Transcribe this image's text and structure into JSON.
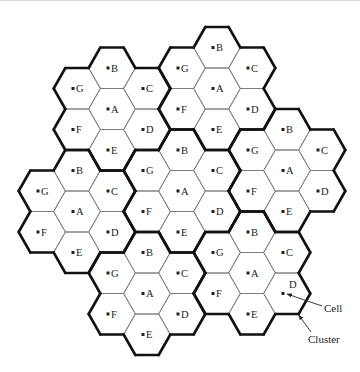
{
  "diagram": {
    "geometry": {
      "hex_radius": 23.33,
      "hex_height": 41
    },
    "cell_offsets": {
      "A": [
        0,
        0
      ],
      "B": [
        0,
        -1
      ],
      "C": [
        1,
        -0.5
      ],
      "D": [
        1,
        0.5
      ],
      "E": [
        0,
        1
      ],
      "F": [
        -1,
        0.5
      ],
      "G": [
        -1,
        -0.5
      ]
    },
    "clusters": [
      {
        "id": "cluster-1",
        "center": [
          112,
          109
        ],
        "cells": [
          "A",
          "B",
          "C",
          "D",
          "E",
          "F",
          "G"
        ]
      },
      {
        "id": "cluster-2",
        "center": [
          217,
          88.5
        ],
        "cells": [
          "A",
          "B",
          "C",
          "D",
          "E",
          "F",
          "G"
        ]
      },
      {
        "id": "cluster-3",
        "center": [
          287,
          170.5
        ],
        "cells": [
          "A",
          "B",
          "C",
          "D",
          "E",
          "F",
          "G"
        ]
      },
      {
        "id": "cluster-4",
        "center": [
          77,
          211.5
        ],
        "cells": [
          "A",
          "B",
          "C",
          "D",
          "E",
          "F",
          "G"
        ]
      },
      {
        "id": "cluster-5",
        "center": [
          182,
          191
        ],
        "cells": [
          "A",
          "B",
          "C",
          "D",
          "E",
          "F",
          "G"
        ]
      },
      {
        "id": "cluster-6",
        "center": [
          147,
          293.5
        ],
        "cells": [
          "A",
          "B",
          "C",
          "D",
          "E",
          "F",
          "G"
        ]
      },
      {
        "id": "cluster-7",
        "center": [
          252,
          273
        ],
        "cells": [
          "A",
          "B",
          "C",
          "D",
          "E",
          "F",
          "G"
        ],
        "annotated_cell": "D"
      }
    ],
    "annotations": {
      "cell": {
        "label": "Cell",
        "text_pos": [
          324,
          312
        ],
        "arrow_from": [
          322,
          306
        ],
        "arrow_to": [
          287,
          294
        ]
      },
      "cluster": {
        "label": "Cluster",
        "text_pos": [
          308,
          343
        ],
        "arrow_from": [
          311,
          332
        ],
        "arrow_to": [
          298.7,
          315
        ]
      },
      "annotated_letter": {
        "label": "D",
        "pos": [
          289,
          288
        ]
      }
    },
    "colors": {
      "cluster_border": "#111111",
      "cell_border": "#7a7a7a",
      "text": "#222222",
      "background": "#ffffff"
    }
  }
}
